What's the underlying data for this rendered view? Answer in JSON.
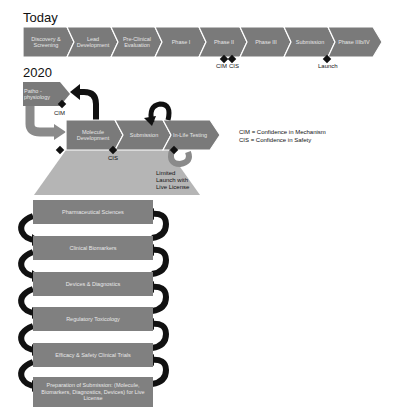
{
  "today": {
    "title": "Today",
    "stages": [
      {
        "label": "Discovery & Screening"
      },
      {
        "label": "Lead Development"
      },
      {
        "label": "Pre-Clinical Evaluation"
      },
      {
        "label": "Phase I"
      },
      {
        "label": "Phase II"
      },
      {
        "label": "Phase III"
      },
      {
        "label": "Submission"
      },
      {
        "label": "Phase IIIb/IV"
      }
    ],
    "markers": {
      "cim": "CIM",
      "cis": "CIS",
      "launch": "Launch"
    }
  },
  "future": {
    "title": "2020",
    "pathophysiology": "Patho -physiology",
    "molecule_development": "Molecule Development",
    "submission": "Submission",
    "in_life_testing": "In-Life Testing",
    "cim_marker": "CIM",
    "cis_marker": "CIS",
    "limited_launch": "Limited Launch with Live License",
    "layers": [
      {
        "label": "Pharmaceutical Sciences"
      },
      {
        "label": "Clinical Biomarkers"
      },
      {
        "label": "Devices & Diagnostics"
      },
      {
        "label": "Regulatory Toxicology"
      },
      {
        "label": "Efficacy & Safety Clinical Trials"
      },
      {
        "label": "Preparation of Submission: (Molecule, Biomarkers, Diagnostics, Devices) for Live License"
      }
    ]
  },
  "legend": {
    "cim": "CIM = Confidence in Mechanism",
    "cis": "CIS = Confidence in Safety"
  },
  "colors": {
    "chevron": "#7a7a7a",
    "funnel": "#b5b5b5",
    "arrow": "#111111",
    "gray_arrow": "#8a8a8a"
  }
}
